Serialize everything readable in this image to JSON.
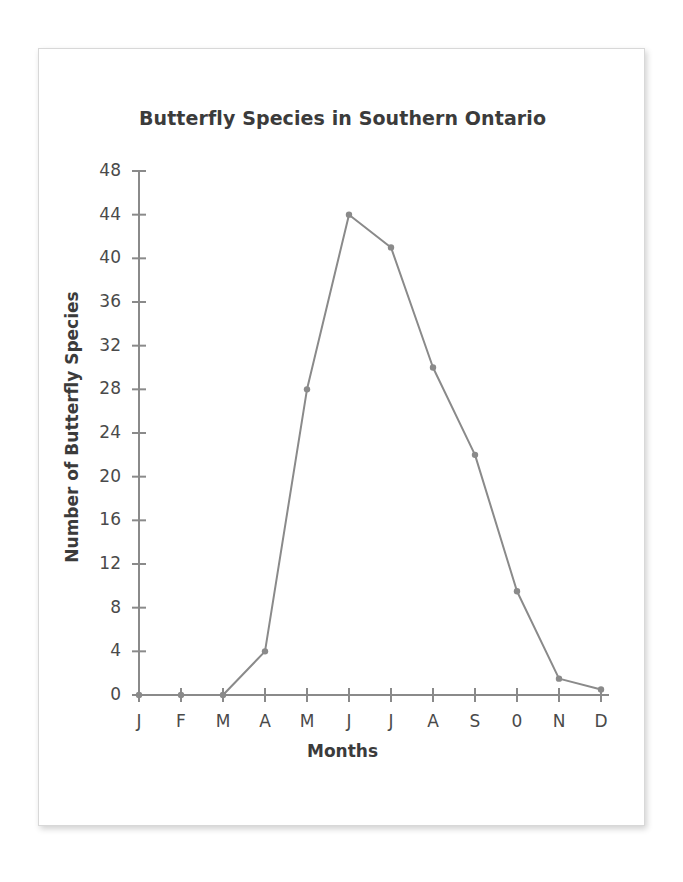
{
  "chart_data": {
    "type": "line",
    "title": "Butterfly Species in Southern Ontario",
    "xlabel": "Months",
    "ylabel": "Number of Butterfly Species",
    "categories": [
      "J",
      "F",
      "M",
      "A",
      "M",
      "J",
      "J",
      "A",
      "S",
      "0",
      "N",
      "D"
    ],
    "category_full_names": [
      "January",
      "February",
      "March",
      "April",
      "May",
      "June",
      "July",
      "August",
      "September",
      "October",
      "November",
      "December"
    ],
    "values": [
      0,
      0,
      0,
      4,
      28,
      44,
      41,
      30,
      22,
      9.5,
      1.5,
      0.5
    ],
    "ylim": [
      0,
      48
    ],
    "y_ticks": [
      0,
      4,
      8,
      12,
      16,
      20,
      24,
      28,
      32,
      36,
      40,
      44,
      48
    ],
    "y_tick_labels": [
      "0",
      "4",
      "8",
      "12",
      "16",
      "20",
      "24",
      "28",
      "32",
      "36",
      "40",
      "44",
      "48"
    ],
    "grid": false,
    "legend": "none",
    "series_color": "#8a8a8a",
    "marker": "circle",
    "axis_color": "#8a8a8a",
    "text_color": "#3b3b3b"
  },
  "card": {
    "border_color": "#d8d8d8",
    "background": "#ffffff"
  }
}
